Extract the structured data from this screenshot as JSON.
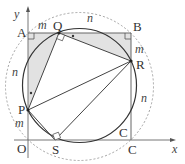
{
  "diagram": {
    "type": "geometry",
    "axes": {
      "x_label": "x",
      "y_label": "y",
      "origin_label": "O"
    },
    "points": {
      "O": {
        "label": "O"
      },
      "A": {
        "label": "A"
      },
      "B": {
        "label": "B"
      },
      "C": {
        "label": "C"
      },
      "P": {
        "label": "P"
      },
      "Q": {
        "label": "Q"
      },
      "R": {
        "label": "R"
      },
      "S": {
        "label": "S"
      }
    },
    "segment_labels": {
      "AQ": "m",
      "QB": "n",
      "BR": "m",
      "RC": "n",
      "CS_arc": "C",
      "OP": "m",
      "PA": "n"
    },
    "colors": {
      "shade": "#e0e0e0",
      "stroke": "#333333",
      "dashed": "#888888"
    }
  }
}
